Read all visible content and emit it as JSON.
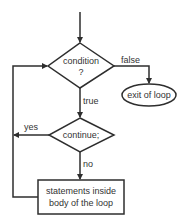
{
  "diagram": {
    "type": "flowchart",
    "colors": {
      "stroke": "#2e2e2e",
      "text": "#333333",
      "background": "#ffffff"
    },
    "nodes": {
      "condition": {
        "line1": "condition",
        "line2": "?"
      },
      "exit": {
        "label": "exit of loop"
      },
      "continue": {
        "label": "continue;"
      },
      "statements": {
        "line1": "statements inside",
        "line2": "body of the loop"
      }
    },
    "edges": {
      "false_label": "false",
      "true_label": "true",
      "yes_label": "yes",
      "no_label": "no"
    }
  }
}
